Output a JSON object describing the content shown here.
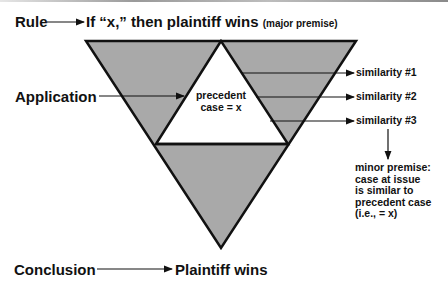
{
  "diagram": {
    "rule": {
      "label": "Rule",
      "statement": "If “x,” then plaintiff wins",
      "note": "(major premise)"
    },
    "application": {
      "label": "Application"
    },
    "center": {
      "line1": "precedent",
      "line2": "case = x"
    },
    "similarities": [
      {
        "label": "similarity #1"
      },
      {
        "label": "similarity #2"
      },
      {
        "label": "similarity #3"
      }
    ],
    "minor_premise": {
      "line1": "minor premise:",
      "line2": "case at issue",
      "line3": "is similar to",
      "line4": "precedent case",
      "line5": "(i.e., = x)"
    },
    "conclusion": {
      "label": "Conclusion",
      "statement": "Plaintiff wins"
    },
    "colors": {
      "fill_gray": "#a9a9a9",
      "stroke": "#111111",
      "inner_fill": "#ffffff"
    }
  }
}
